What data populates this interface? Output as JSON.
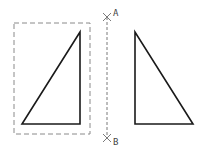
{
  "diagram": {
    "type": "mirror-operation",
    "colors": {
      "shape": "#1a1a1a",
      "selection": "#8a8a8a",
      "mirror_line": "#7a7a7a",
      "label": "#444444"
    },
    "source_triangle": {
      "points": [
        [
          80,
          32
        ],
        [
          22,
          124
        ],
        [
          80,
          124
        ]
      ]
    },
    "selection_box": {
      "x": 14,
      "y": 23,
      "width": 76,
      "height": 111
    },
    "mirror_line": {
      "x": 107,
      "y1": 17,
      "y2": 138
    },
    "points": [
      {
        "label": "A",
        "x": 107,
        "y": 17
      },
      {
        "label": "B",
        "x": 107,
        "y": 138
      }
    ],
    "mirrored_triangle": {
      "points": [
        [
          135,
          32
        ],
        [
          135,
          124
        ],
        [
          193,
          124
        ]
      ]
    }
  }
}
